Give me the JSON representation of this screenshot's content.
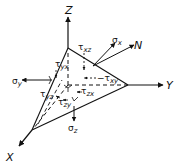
{
  "diagram": {
    "axes": {
      "x": "X",
      "y": "Y",
      "z": "Z"
    },
    "normal": "N",
    "stresses": {
      "sigma_x": {
        "base": "σ",
        "sub": "x"
      },
      "sigma_y": {
        "base": "σ",
        "sub": "y"
      },
      "sigma_z": {
        "base": "σ",
        "sub": "z"
      },
      "tau_xz": {
        "base": "τ",
        "sub": "xz"
      },
      "tau_xy": {
        "prefix": "−",
        "base": "τ",
        "sub": "xy"
      },
      "tau_yx": {
        "base": "τ",
        "sub": "yx"
      },
      "tau_yz": {
        "base": "τ",
        "sub": "yz"
      },
      "tau_zx": {
        "base": "τ",
        "sub": "zx"
      },
      "tau_zy": {
        "base": "τ",
        "sub": "zy"
      }
    },
    "colors": {
      "ink": "#111111",
      "background": "#ffffff"
    }
  }
}
